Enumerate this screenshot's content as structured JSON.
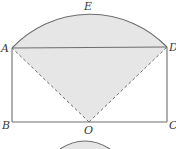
{
  "diagram": {
    "type": "geometry",
    "colors": {
      "line": "#6e6e6e",
      "shade": "#e6e6e6",
      "label": "#3a3a3a",
      "background": "#ffffff"
    },
    "points": {
      "A": {
        "label": "A",
        "x": 12,
        "y": 48
      },
      "B": {
        "label": "B",
        "x": 12,
        "y": 122
      },
      "C": {
        "label": "C",
        "x": 167,
        "y": 122
      },
      "D": {
        "label": "D",
        "x": 167,
        "y": 47
      },
      "O": {
        "label": "O",
        "x": 89,
        "y": 122
      },
      "E": {
        "label": "E",
        "x": 89,
        "y": 15
      }
    },
    "labels": [
      {
        "text": "A",
        "x": 1,
        "y": 52
      },
      {
        "text": "D",
        "x": 169,
        "y": 51
      },
      {
        "text": "E",
        "x": 84,
        "y": 10
      },
      {
        "text": "B",
        "x": 2,
        "y": 129
      },
      {
        "text": "O",
        "x": 84,
        "y": 134
      },
      {
        "text": "C",
        "x": 169,
        "y": 129
      }
    ],
    "segments": [
      {
        "name": "AD",
        "style": "solid"
      },
      {
        "name": "AB",
        "style": "solid"
      },
      {
        "name": "BC",
        "style": "solid"
      },
      {
        "name": "CD",
        "style": "solid"
      },
      {
        "name": "OA",
        "style": "dashed"
      },
      {
        "name": "OD",
        "style": "dashed"
      }
    ],
    "arcs": [
      {
        "name": "AED",
        "center": "O",
        "radius": 107
      }
    ],
    "partial_figure_below": {
      "description": "top of a second shaded arc figure, cut off at bottom edge"
    }
  }
}
